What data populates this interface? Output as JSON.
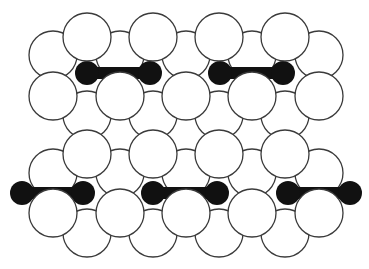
{
  "figure": {
    "title": "",
    "colors": {
      "atom_fill": "#ffffff",
      "atom_stroke": "#3a3a3a",
      "molecule": "#111111",
      "background": "#ffffff"
    },
    "atom_radius": 24,
    "back_layers": [
      {
        "y": 55,
        "xs": [
          53,
          120,
          186,
          252,
          319
        ]
      },
      {
        "y": 115,
        "xs": [
          87,
          153,
          219,
          285
        ]
      },
      {
        "y": 173,
        "xs": [
          53,
          120,
          186,
          252,
          319
        ]
      },
      {
        "y": 233,
        "xs": [
          87,
          153,
          219,
          285
        ]
      }
    ],
    "molecules": [
      {
        "x1": 87,
        "x2": 150,
        "y": 73,
        "r": 12
      },
      {
        "x1": 220,
        "x2": 283,
        "y": 73,
        "r": 12
      },
      {
        "x1": 22,
        "x2": 83,
        "y": 193,
        "r": 12
      },
      {
        "x1": 153,
        "x2": 217,
        "y": 193,
        "r": 12
      },
      {
        "x1": 288,
        "x2": 350,
        "y": 193,
        "r": 12
      }
    ],
    "front_layers": [
      {
        "y": 37,
        "xs": [
          87,
          153,
          219,
          285
        ]
      },
      {
        "y": 96,
        "xs": [
          53,
          120,
          186,
          252,
          319
        ]
      },
      {
        "y": 154,
        "xs": [
          87,
          153,
          219,
          285
        ]
      },
      {
        "y": 213,
        "xs": [
          53,
          120,
          186,
          252,
          319
        ]
      }
    ]
  }
}
